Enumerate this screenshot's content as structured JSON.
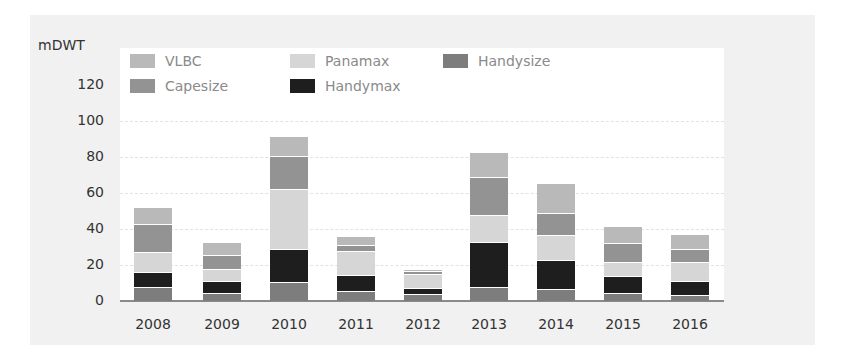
{
  "chart_data": {
    "type": "bar",
    "stacked": true,
    "title": "",
    "xlabel": "",
    "ylabel": "mDWT",
    "ylim": [
      0,
      130
    ],
    "yticks": [
      0,
      20,
      40,
      60,
      80,
      100,
      120
    ],
    "grid": true,
    "legend_position": "top-left inside",
    "categories": [
      "2008",
      "2009",
      "2010",
      "2011",
      "2012",
      "2013",
      "2014",
      "2015",
      "2016"
    ],
    "series": [
      {
        "name": "Handysize",
        "color": "#7d7d7d",
        "values": [
          8,
          4.5,
          10.5,
          5.5,
          4,
          8,
          6.5,
          4.5,
          3.5
        ]
      },
      {
        "name": "Handymax",
        "color": "#1e1e1e",
        "values": [
          8,
          6.5,
          18.5,
          9,
          3,
          25,
          16.5,
          9.5,
          7.5
        ]
      },
      {
        "name": "Panamax",
        "color": "#d6d6d6",
        "values": [
          11,
          7,
          33,
          13.5,
          8,
          15,
          13.5,
          7.5,
          10.5
        ]
      },
      {
        "name": "Capesize",
        "color": "#939393",
        "values": [
          16,
          7.5,
          18.5,
          3,
          1.5,
          21,
          12.5,
          10.5,
          7.5
        ]
      },
      {
        "name": "VLBC",
        "color": "#b9b9b9",
        "values": [
          9,
          7.5,
          11,
          5,
          1.5,
          14,
          16.5,
          9.5,
          8
        ]
      }
    ],
    "totals": [
      52,
      33,
      91.5,
      36,
      18,
      83,
      65.5,
      41.5,
      37
    ]
  },
  "legend": [
    {
      "label": "VLBC",
      "color": "#b9b9b9"
    },
    {
      "label": "Panamax",
      "color": "#d6d6d6"
    },
    {
      "label": "Handysize",
      "color": "#7d7d7d"
    },
    {
      "label": "Capesize",
      "color": "#939393"
    },
    {
      "label": "Handymax",
      "color": "#1e1e1e"
    }
  ]
}
